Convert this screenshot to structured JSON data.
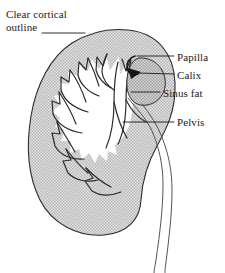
{
  "figure": {
    "background_color": "#ffffff",
    "ink_color": "#1a1a1a",
    "parenchyma_fill": "#c9c9c9",
    "sinus_fat_fill": "#b9b9b9",
    "calyx_fill": "#ffffff"
  },
  "labels": {
    "cortical_outline": "Clear cortical outline",
    "papilla": "Papilla",
    "calix": "Calix",
    "sinus_fat": "Sinus fat",
    "pelvis": "Pelvis"
  },
  "structures": {
    "cortex": "kidney-cortex-outline",
    "medullary_pyramids": "renal-pyramids",
    "calyces": "renal-calyces",
    "papilla": "renal-papilla",
    "sinus_fat": "renal-sinus-fat",
    "pelvis": "renal-pelvis",
    "ureter": "ureter"
  },
  "leader_lines": {
    "cortical_outline": "from text to upper-left cortical margin",
    "papilla": "from text to papilla hook at sinus",
    "calix": "from text to dark calyceal triangle",
    "sinus_fat": "from text into shaded sinus fat oval",
    "pelvis": "from text to renal pelvis lumen"
  }
}
